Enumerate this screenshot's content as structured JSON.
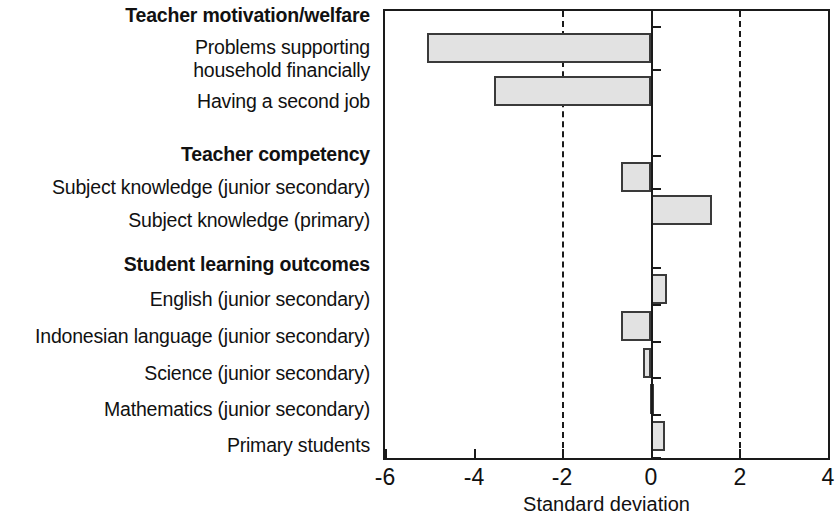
{
  "chart_data": {
    "type": "bar",
    "orientation": "horizontal",
    "title": "",
    "xlabel": "Standard deviation",
    "ylabel": "",
    "xlim": [
      -6,
      4
    ],
    "xticks": [
      -6,
      -4,
      -2,
      0,
      2,
      4
    ],
    "xtick_labels": [
      "-6",
      "-4",
      "-2",
      "0",
      "2",
      "4"
    ],
    "grid": "vertical dashed gridlines at -2 and 2; solid reference line at 0",
    "gridlines": [
      -2,
      2
    ],
    "zero_line": 0,
    "legend": "none",
    "bar_fill_color": "#e2e2e2",
    "bar_edge_color": "#3a3a3a",
    "axis_color": "#1a1a1a",
    "groups": [
      {
        "label": "Teacher motivation/welfare",
        "items": [
          {
            "label": "Problems supporting household financially",
            "label_lines": [
              "Problems supporting",
              "household financially"
            ],
            "value": -5.05
          },
          {
            "label": "Having a second job",
            "label_lines": [
              "Having a second job"
            ],
            "value": -3.53
          }
        ]
      },
      {
        "label": "Teacher competency",
        "items": [
          {
            "label": "Subject knowledge (junior secondary)",
            "label_lines": [
              "Subject knowledge (junior secondary)"
            ],
            "value": -0.68
          },
          {
            "label": "Subject knowledge (primary)",
            "label_lines": [
              "Subject knowledge (primary)"
            ],
            "value": 1.38
          }
        ]
      },
      {
        "label": "Student learning outcomes",
        "items": [
          {
            "label": "English (junior secondary)",
            "label_lines": [
              "English (junior secondary)"
            ],
            "value": 0.37
          },
          {
            "label": "Indonesian language (junior secondary)",
            "label_lines": [
              "Indonesian language (junior secondary)"
            ],
            "value": -0.68
          },
          {
            "label": "Science (junior secondary)",
            "label_lines": [
              "Science (junior secondary)"
            ],
            "value": -0.17
          },
          {
            "label": "Mathematics (junior secondary)",
            "label_lines": [
              "Mathematics (junior secondary)"
            ],
            "value": -0.02
          },
          {
            "label": "Primary students",
            "label_lines": [
              "Primary students"
            ],
            "value": 0.31
          }
        ]
      }
    ],
    "categories": [
      "Problems supporting household financially",
      "Having a second job",
      "Subject knowledge (junior secondary)",
      "Subject knowledge (primary)",
      "English (junior secondary)",
      "Indonesian language (junior secondary)",
      "Science (junior secondary)",
      "Mathematics (junior secondary)",
      "Primary students"
    ],
    "values": [
      -5.05,
      -3.53,
      -0.68,
      1.38,
      0.37,
      -0.68,
      -0.17,
      -0.02,
      0.31
    ]
  },
  "labels": {
    "group_motivation": "Teacher motivation/welfare",
    "row_problems_l1": "Problems supporting",
    "row_problems_l2": "household financially",
    "row_second_job": "Having a second job",
    "group_competency": "Teacher competency",
    "row_sk_junior": "Subject knowledge (junior secondary)",
    "row_sk_primary": "Subject knowledge (primary)",
    "group_outcomes": "Student learning outcomes",
    "row_english": "English (junior secondary)",
    "row_indonesian": "Indonesian language (junior secondary)",
    "row_science": "Science (junior secondary)",
    "row_math": "Mathematics (junior secondary)",
    "row_primary_students": "Primary students"
  },
  "axis": {
    "title": "Standard deviation",
    "tick_neg6": "-6",
    "tick_neg4": "-4",
    "tick_neg2": "-2",
    "tick_0": "0",
    "tick_2": "2",
    "tick_4": "4"
  }
}
